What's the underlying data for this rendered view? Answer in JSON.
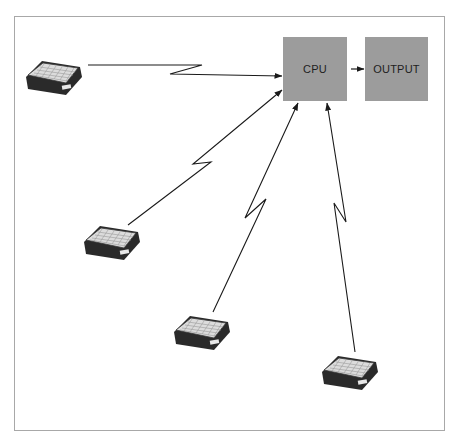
{
  "diagram": {
    "type": "network topology",
    "nodes": {
      "cpu": {
        "label": "CPU"
      },
      "output": {
        "label": "OUTPUT"
      },
      "terminals": [
        {
          "label": "",
          "kind": "remote-terminal"
        },
        {
          "label": "",
          "kind": "remote-terminal"
        },
        {
          "label": "",
          "kind": "remote-terminal"
        },
        {
          "label": "",
          "kind": "remote-terminal"
        }
      ]
    },
    "edges": [
      {
        "from": "terminal-1",
        "to": "cpu",
        "style": "lightning-link"
      },
      {
        "from": "terminal-2",
        "to": "cpu",
        "style": "lightning-link"
      },
      {
        "from": "terminal-3",
        "to": "cpu",
        "style": "lightning-link"
      },
      {
        "from": "terminal-4",
        "to": "cpu",
        "style": "lightning-link"
      },
      {
        "from": "cpu",
        "to": "output",
        "style": "arrow"
      }
    ],
    "colors": {
      "node_fill": "#9c9c9c",
      "line": "#1a1a1a",
      "frame_border": "#a8a8a8"
    }
  }
}
